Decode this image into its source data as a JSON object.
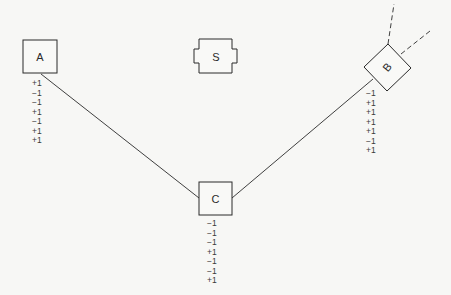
{
  "diagram": {
    "stroke_color": "#2a2a2a",
    "background": "#f7f7f5",
    "nodes": {
      "A": {
        "label": "A",
        "values": [
          "+1",
          "−1",
          "−1",
          "+1",
          "−1",
          "+1",
          "+1"
        ]
      },
      "S": {
        "label": "S"
      },
      "B": {
        "label": "B",
        "values": [
          "−1",
          "+1",
          "+1",
          "+1",
          "+1",
          "−1",
          "+1"
        ]
      },
      "C": {
        "label": "C",
        "values": [
          "−1",
          "−1",
          "−1",
          "+1",
          "−1",
          "−1",
          "+1"
        ]
      }
    },
    "edges": [
      {
        "from": "A",
        "to": "C",
        "style": "solid"
      },
      {
        "from": "C",
        "to": "B",
        "style": "solid"
      },
      {
        "from": "B",
        "to": "offscreen-up",
        "style": "dashed"
      },
      {
        "from": "B",
        "to": "offscreen-right",
        "style": "dashed"
      }
    ]
  }
}
